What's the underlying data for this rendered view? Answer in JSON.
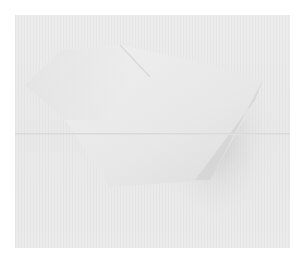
{
  "image": {
    "description": "White folded paper-like shape on a light gray textured background with a horizontal fold line",
    "colors": {
      "border": "#ffffff",
      "background": "#eaeaea",
      "shape_light": "#f2f2f2",
      "shape_shadow": "#c8c8c8",
      "cast_shadow": "#cfcfcf"
    }
  }
}
